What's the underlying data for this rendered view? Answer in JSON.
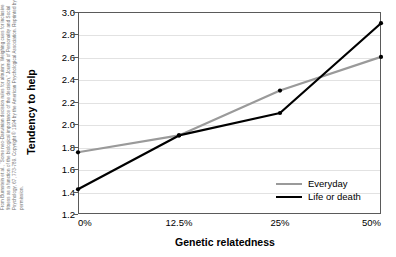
{
  "credit": {
    "text": "From Burnstein et al., “Some neo-Darwinian decision rules for altruism: Weighing cues for inclusive fitness as a function of the biological importance of the decision,” Journal of Personality and Social Psychology, 67, 773-789.  Copyright © 1994 by the American Psychological Association. Reprinted by permission."
  },
  "chart_data": {
    "type": "line",
    "title": "",
    "xlabel": "Genetic relatedness",
    "ylabel": "Tendency to help",
    "categories": [
      "0%",
      "12.5%",
      "25%",
      "50%"
    ],
    "ylim": [
      1.2,
      3.0
    ],
    "yticks": [
      "1.2",
      "1.4",
      "1.6",
      "1.8",
      "2.0",
      "2.2",
      "2.4",
      "2.6",
      "2.8",
      "3.0"
    ],
    "ytick_values": [
      1.2,
      1.4,
      1.6,
      1.8,
      2.0,
      2.2,
      2.4,
      2.6,
      2.8,
      3.0
    ],
    "grid": true,
    "legend_position": "inside-bottom-right",
    "series": [
      {
        "name": "Everyday",
        "color": "#9a9a9a",
        "width": 2.2,
        "values": [
          1.75,
          1.9,
          2.3,
          2.6
        ]
      },
      {
        "name": "Life or death",
        "color": "#000000",
        "width": 2.2,
        "values": [
          1.42,
          1.9,
          2.1,
          2.9
        ]
      }
    ]
  }
}
